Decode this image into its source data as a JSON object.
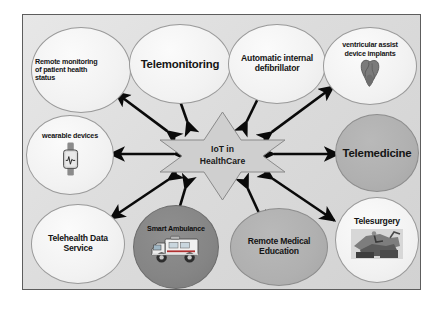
{
  "figure": {
    "panel_background": "#dcdcdc",
    "panel_border_color": "#5d5d5d",
    "arrow_color": "#0a0a0a",
    "page_background": "#ffffff"
  },
  "center": {
    "name": "iot-in-healthcare-star",
    "label": "IoT in\nHealthCare",
    "shape": "six-pointed-star",
    "fill": "#cfcfcf",
    "stroke": "#8a8a8a"
  },
  "nodes": [
    {
      "id": "remote-monitoring",
      "label": "Remote monitoring\nof patient health\nstatus",
      "fill": "light",
      "text_size": "small",
      "align": "left",
      "icon": null
    },
    {
      "id": "telemonitoring",
      "label": "Telemonitoring",
      "fill": "light",
      "text_size": "big",
      "align": "center",
      "icon": null
    },
    {
      "id": "automatic-internal-defibrillator",
      "label": "Automatic internal\ndefibrillator",
      "fill": "light",
      "text_size": "med",
      "align": "center",
      "icon": null
    },
    {
      "id": "ventricular-assist-device-implants",
      "label": "ventricular assist\ndevice implants",
      "fill": "light",
      "text_size": "small",
      "align": "center",
      "icon": "heart-icon"
    },
    {
      "id": "wearable-devices",
      "label": "wearable devices",
      "fill": "light",
      "text_size": "small",
      "align": "center",
      "icon": "smartwatch-icon"
    },
    {
      "id": "telemedicine",
      "label": "Telemedicine",
      "fill": "mid",
      "text_size": "big",
      "align": "center",
      "icon": null
    },
    {
      "id": "telehealth-data-service",
      "label": "Telehealth Data\nService",
      "fill": "light",
      "text_size": "med",
      "align": "center",
      "icon": null
    },
    {
      "id": "smart-ambulance",
      "label": "Smart Ambulance",
      "fill": "dark",
      "text_size": "small",
      "align": "center",
      "icon": "ambulance-icon"
    },
    {
      "id": "remote-medical-education",
      "label": "Remote Medical\nEducation",
      "fill": "mid",
      "text_size": "med",
      "align": "center",
      "icon": null
    },
    {
      "id": "telesurgery",
      "label": "Telesurgery",
      "fill": "light",
      "text_size": "med",
      "align": "center",
      "icon": "surgical-robot-icon"
    }
  ],
  "connectors": {
    "style": "double-headed-arrow",
    "count": 10,
    "from": "iot-in-healthcare-star",
    "to": [
      "remote-monitoring",
      "telemonitoring",
      "automatic-internal-defibrillator",
      "ventricular-assist-device-implants",
      "wearable-devices",
      "telemedicine",
      "telehealth-data-service",
      "smart-ambulance",
      "remote-medical-education",
      "telesurgery"
    ]
  }
}
